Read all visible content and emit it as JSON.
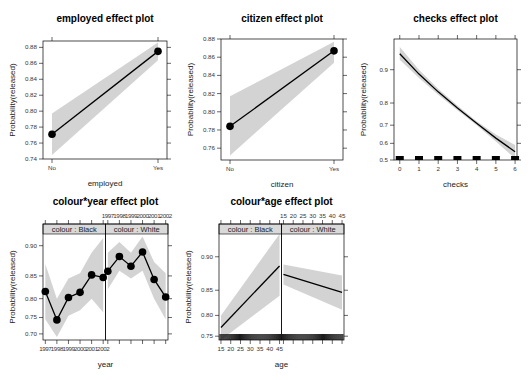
{
  "chart_data": [
    {
      "id": "employed",
      "type": "line",
      "title": "employed effect plot",
      "xlabel": "employed",
      "ylabel": "Probability(released)",
      "x_kind": "categorical",
      "categories": [
        "No",
        "Yes"
      ],
      "values": [
        0.771,
        0.875
      ],
      "lower": [
        0.745,
        0.864
      ],
      "upper": [
        0.797,
        0.886
      ],
      "points": true,
      "yticks": [
        0.74,
        0.76,
        0.78,
        0.8,
        0.82,
        0.84,
        0.86,
        0.88
      ],
      "ytick_labels": [
        "0.74",
        "0.76",
        "0.78",
        "0.80",
        "0.82",
        "0.84",
        "0.86",
        "0.88"
      ],
      "ylim": [
        0.74,
        0.888
      ],
      "panel": {
        "x": 43,
        "y": 41,
        "w": 124,
        "h": 118
      }
    },
    {
      "id": "citizen",
      "type": "line",
      "title": "citizen effect plot",
      "xlabel": "citizen",
      "ylabel": "Probability(released)",
      "x_kind": "categorical",
      "categories": [
        "No",
        "Yes"
      ],
      "values": [
        0.784,
        0.867
      ],
      "lower": [
        0.752,
        0.854
      ],
      "upper": [
        0.817,
        0.877
      ],
      "points": true,
      "yticks": [
        0.76,
        0.78,
        0.8,
        0.82,
        0.84,
        0.86,
        0.88
      ],
      "ytick_labels": [
        "0.76",
        "0.78",
        "0.80",
        "0.82",
        "0.84",
        "0.86",
        "0.88"
      ],
      "ylim": [
        0.747,
        0.88
      ],
      "panel": {
        "x": 221,
        "y": 39,
        "w": 122,
        "h": 121
      }
    },
    {
      "id": "checks",
      "type": "line",
      "title": "checks effect plot",
      "xlabel": "checks",
      "ylabel": "Probability(released)",
      "x_kind": "numeric",
      "x": [
        0,
        1,
        2,
        3,
        4,
        5,
        6
      ],
      "values": [
        0.93,
        0.89,
        0.84,
        0.78,
        0.71,
        0.63,
        0.55
      ],
      "lower": [
        0.92,
        0.88,
        0.83,
        0.77,
        0.7,
        0.61,
        0.51
      ],
      "upper": [
        0.94,
        0.9,
        0.85,
        0.79,
        0.72,
        0.65,
        0.59
      ],
      "points": false,
      "rug": [
        0,
        1,
        2,
        3,
        4,
        5,
        6
      ],
      "xticks": [
        0,
        1,
        2,
        3,
        4,
        5,
        6
      ],
      "xtick_labels": [
        "0",
        "1",
        "2",
        "3",
        "4",
        "5",
        "6"
      ],
      "yticks": [
        0.5,
        0.6,
        0.7,
        0.8,
        0.9
      ],
      "ytick_labels": [
        "0.5",
        "0.6",
        "0.7",
        "0.8",
        "0.9"
      ],
      "yscale": "logit",
      "ylim": [
        0.5,
        0.95
      ],
      "xlim": [
        -0.3,
        6.1
      ],
      "panel": {
        "x": 394,
        "y": 39,
        "w": 123,
        "h": 121
      }
    },
    {
      "id": "colour_year",
      "type": "line",
      "title": "colour*year effect plot",
      "xlabel": "year",
      "ylabel": "Probability(released)",
      "x_kind": "numeric",
      "x": [
        1997,
        1998,
        1999,
        2000,
        2001,
        2002
      ],
      "xticks": [
        1997,
        1998,
        1999,
        2000,
        2001,
        2002
      ],
      "xtick_labels": [
        "1997",
        "1998",
        "1999",
        "2000",
        "2001",
        "2002"
      ],
      "xlim": [
        1996.8,
        2002.2
      ],
      "yscale": "logit",
      "yticks": [
        0.7,
        0.75,
        0.8,
        0.85,
        0.9
      ],
      "ytick_labels": [
        "0.70",
        "0.75",
        "0.80",
        "0.85",
        "0.90"
      ],
      "ylim": [
        0.68,
        0.915
      ],
      "points": true,
      "series": [
        {
          "name": "colour : Black",
          "values": [
            0.817,
            0.743,
            0.803,
            0.815,
            0.852,
            0.847
          ],
          "lower": [
            0.745,
            0.69,
            0.755,
            0.77,
            0.8,
            0.765
          ],
          "upper": [
            0.872,
            0.8,
            0.845,
            0.855,
            0.89,
            0.91
          ]
        },
        {
          "name": "colour : White",
          "values": [
            0.859,
            0.884,
            0.868,
            0.891,
            0.843,
            0.804
          ],
          "lower": [
            0.822,
            0.86,
            0.845,
            0.86,
            0.8,
            0.745
          ],
          "upper": [
            0.89,
            0.905,
            0.89,
            0.912,
            0.875,
            0.855
          ]
        }
      ],
      "panel": {
        "x": 43,
        "y": 224,
        "w": 125,
        "h": 116,
        "strip_h": 10
      }
    },
    {
      "id": "colour_age",
      "type": "line",
      "title": "colour*age effect plot",
      "xlabel": "age",
      "ylabel": "Probability(released)",
      "x_kind": "numeric",
      "x": [
        15,
        45
      ],
      "xticks": [
        15,
        20,
        25,
        30,
        35,
        40,
        45
      ],
      "xtick_labels": [
        "15",
        "20",
        "25",
        "30",
        "35",
        "40",
        "45"
      ],
      "xlim": [
        14,
        46
      ],
      "yscale": "logit",
      "yticks": [
        0.75,
        0.8,
        0.85,
        0.9
      ],
      "ytick_labels": [
        "0.75",
        "0.80",
        "0.85",
        "0.90"
      ],
      "ylim": [
        0.74,
        0.925
      ],
      "points": false,
      "rug": "dense",
      "series": [
        {
          "name": "colour : Black",
          "values": [
            0.772,
            0.888
          ],
          "lower": [
            0.74,
            0.84
          ],
          "upper": [
            0.8,
            0.925
          ]
        },
        {
          "name": "colour : White",
          "values": [
            0.876,
            0.846
          ],
          "lower": [
            0.86,
            0.812
          ],
          "upper": [
            0.89,
            0.874
          ]
        }
      ],
      "panel": {
        "x": 219,
        "y": 224,
        "w": 125,
        "h": 116,
        "strip_h": 10
      }
    }
  ],
  "colors": {
    "band": "#d3d3d3",
    "line": "#000000",
    "strip_bg": "#d9d9d9",
    "axis": "#000000"
  }
}
